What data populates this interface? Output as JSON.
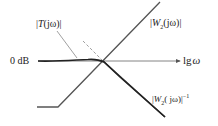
{
  "diagram": {
    "type": "bode-magnitude-asymptotes",
    "axis": {
      "y_reference_label": "0 dB",
      "x_label": "lg ω",
      "x_label_parts": {
        "lg": "lg",
        "omega": "ω"
      }
    },
    "curves": [
      {
        "id": "T",
        "label": "|T(jω)|",
        "style": "solid-thick",
        "color": "#2a2a2a"
      },
      {
        "id": "W2",
        "label": "|W₂(jω)|",
        "style": "solid",
        "color": "#3a3a3a"
      },
      {
        "id": "W2inv",
        "label": "|W₂(jω)|⁻¹",
        "style": "solid",
        "color": "#3a3a3a"
      },
      {
        "id": "W2inv-ext",
        "label": "",
        "style": "dashed",
        "color": "#777777"
      }
    ],
    "labels": {
      "T": {
        "bar_l": "|",
        "name": "T",
        "arg": "(jω)",
        "bar_r": "|"
      },
      "W2": {
        "bar_l": "|",
        "name": "W",
        "sub": "2",
        "arg": "(jω)",
        "bar_r": "|"
      },
      "W2inv": {
        "bar_l": "|",
        "name": "W",
        "sub": "2",
        "arg": "( jω)",
        "bar_r": "|",
        "sup": "−1"
      }
    },
    "colors": {
      "line": "#333333",
      "dashed": "#777777",
      "text": "#222222",
      "background": "#ffffff"
    }
  }
}
